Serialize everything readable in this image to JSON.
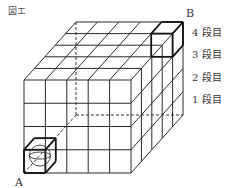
{
  "figure": {
    "title": "図エ",
    "corner_a": "A",
    "corner_b": "B",
    "tiers": [
      "4 段目",
      "3 段目",
      "2 段目",
      "1 段目"
    ],
    "cube_grid": {
      "columns": 5,
      "rows": 4,
      "depth": 5
    },
    "start_cell": {
      "label": "A",
      "column": 1,
      "row": 1,
      "depth": 1,
      "contains": "sphere"
    },
    "end_cell": {
      "label": "B",
      "column": 5,
      "row": 4,
      "depth": 5
    },
    "hidden_edges": "dashed"
  }
}
